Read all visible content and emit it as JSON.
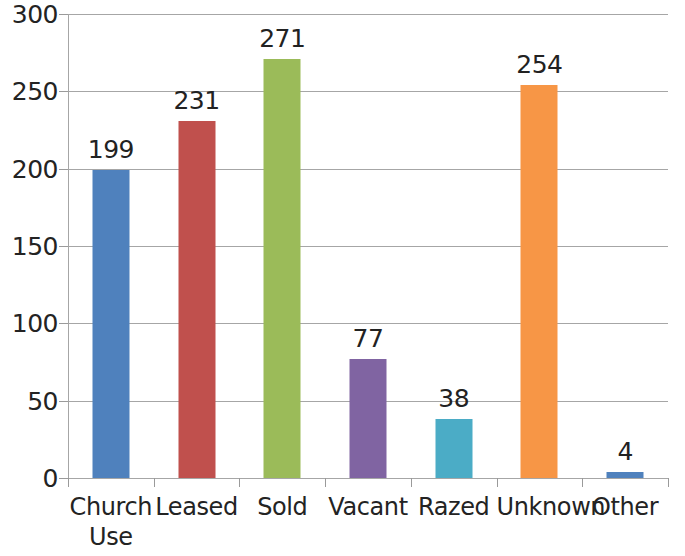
{
  "chart_data": {
    "type": "bar",
    "title": "",
    "subtitle": "",
    "xlabel": "",
    "ylabel": "",
    "ylim": [
      0,
      300
    ],
    "ytick_step": 50,
    "ytick_labels": [
      "300",
      "250",
      "200",
      "150",
      "100",
      "50",
      "0"
    ],
    "ytick_values": [
      300,
      250,
      200,
      150,
      100,
      50,
      0
    ],
    "grid": true,
    "legend": false,
    "legend_position": "none",
    "categories": [
      "Church Use",
      "Leased",
      "Sold",
      "Vacant",
      "Razed",
      "Unknown",
      "Other"
    ],
    "category_lines": [
      [
        "Church",
        "Use"
      ],
      [
        "Leased"
      ],
      [
        "Sold"
      ],
      [
        "Vacant"
      ],
      [
        "Razed"
      ],
      [
        "Unknown"
      ],
      [
        "Other"
      ]
    ],
    "values": [
      199,
      231,
      271,
      77,
      38,
      254,
      4
    ],
    "value_labels": [
      "199",
      "231",
      "271",
      "77",
      "38",
      "254",
      "4"
    ],
    "colors": [
      "#4F81BD",
      "#C0504D",
      "#9BBB59",
      "#8064A2",
      "#4BACC6",
      "#F79646",
      "#4F81BD"
    ],
    "series": [
      {
        "name": "Count",
        "values": [
          199,
          231,
          271,
          77,
          38,
          254,
          4
        ]
      }
    ]
  },
  "style": {
    "background": "#ffffff",
    "gridline_color": "#a6a6a6",
    "axis_color": "#9a9a9a",
    "text_color": "#232323"
  }
}
